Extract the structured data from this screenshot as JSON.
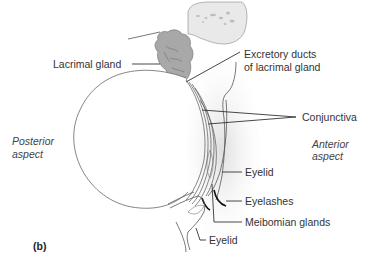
{
  "figure": {
    "panel_label": "(b)",
    "labels": {
      "lacrimal_gland": "Lacrimal gland",
      "excretory_ducts_line1": "Excretory ducts",
      "excretory_ducts_line2": "of lacrimal gland",
      "conjunctiva": "Conjunctiva",
      "posterior_line1": "Posterior",
      "posterior_line2": "aspect",
      "anterior_line1": "Anterior",
      "anterior_line2": "aspect",
      "eyelid_upper": "Eyelid",
      "eyelashes": "Eyelashes",
      "meibomian_glands": "Meibomian glands",
      "eyelid_lower": "Eyelid"
    },
    "colors": {
      "bone": "#e6e6e6",
      "gland": "#a9a9a9",
      "shading": "#e8e8e8",
      "lines": "#333333"
    }
  }
}
